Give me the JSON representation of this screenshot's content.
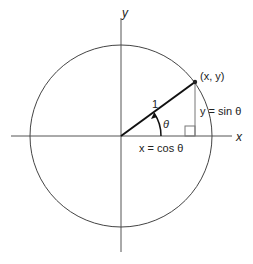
{
  "diagram": {
    "labels": {
      "y_axis": "y",
      "x_axis": "x",
      "point": "(x, y)",
      "radius": "1",
      "angle": "θ",
      "sin": "y = sin θ",
      "cos": "x = cos θ"
    },
    "geometry": {
      "center": [
        121,
        136
      ],
      "radius_px": 91,
      "point": [
        195,
        82
      ]
    },
    "colors": {
      "stroke": "#333333",
      "thin": "#666666",
      "background": "#ffffff"
    }
  }
}
